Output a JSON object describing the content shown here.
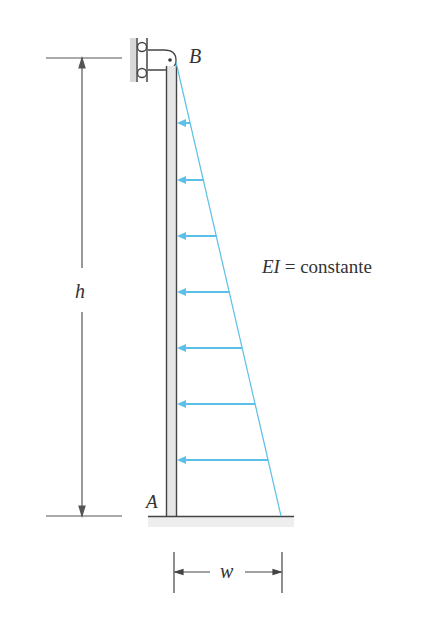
{
  "labels": {
    "top_support": "B",
    "base": "A",
    "height": "h",
    "load_width": "w",
    "stiffness_lhs": "EI",
    "stiffness_eq": " = constante"
  },
  "colors": {
    "load": "#5bbfe8",
    "structure": "#4a4a4a",
    "hatch": "#c8c8c8"
  },
  "load_arrows_y": [
    123,
    180,
    236,
    292,
    348,
    404,
    460
  ]
}
